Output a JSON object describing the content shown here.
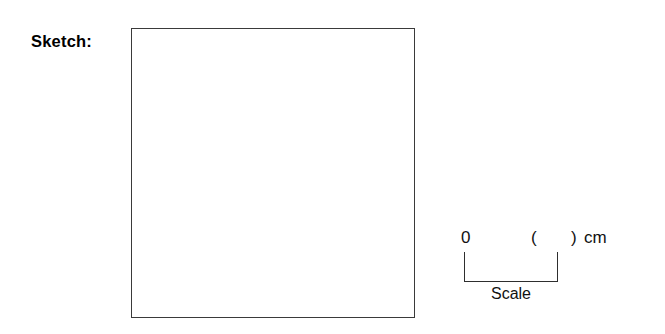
{
  "sheet": {
    "background_color": "#ffffff",
    "ink_color": "#1a1a1a"
  },
  "sketch": {
    "label": "Sketch:",
    "box": {
      "fill_color": "#ffffff",
      "border_color": "#3a3a3a",
      "content": ""
    }
  },
  "scale_legend": {
    "zero_label": "0",
    "paren_open": "(",
    "paren_close": ")",
    "unit_label": "cm",
    "caption": "Scale",
    "bracket_color": "#2e2e2e"
  }
}
